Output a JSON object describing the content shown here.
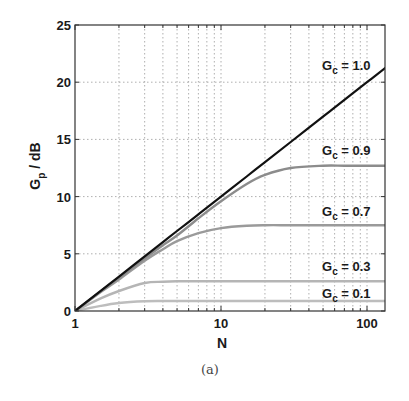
{
  "chart_data": {
    "type": "line",
    "title": "",
    "caption": "(a)",
    "xlabel": "N",
    "ylabel": "G_p / dB",
    "ylabel_main": "G",
    "ylabel_sub": "p",
    "ylabel_rest": " / dB",
    "xscale": "log",
    "xlim": [
      1,
      133
    ],
    "ylim": [
      0,
      25
    ],
    "grid": true,
    "legend": "inline labels",
    "x_ticks": [
      1,
      10,
      100
    ],
    "x_tick_labels": [
      "1",
      "10",
      "100"
    ],
    "y_ticks": [
      0,
      5,
      10,
      15,
      20,
      25
    ],
    "y_tick_labels": [
      "0",
      "5",
      "10",
      "15",
      "20",
      "25"
    ],
    "x": [
      1,
      1.5,
      2,
      3,
      4,
      5,
      7,
      10,
      15,
      20,
      30,
      50,
      70,
      100,
      133
    ],
    "series": [
      {
        "name": "G_c = 1.0",
        "label_main": "G",
        "label_sub": "c",
        "label_rest": " = 1.0",
        "color": "#111111",
        "values": [
          0,
          1.76,
          3.01,
          4.77,
          6.02,
          6.99,
          8.45,
          10.0,
          11.76,
          13.01,
          14.77,
          16.99,
          18.45,
          20.0,
          21.24
        ],
        "label_pos": [
          322,
          70
        ]
      },
      {
        "name": "G_c = 0.9",
        "label_main": "G",
        "label_sub": "c",
        "label_rest": " = 0.9",
        "color": "#8c8c8c",
        "values": [
          0,
          1.72,
          2.9,
          4.6,
          5.75,
          6.6,
          8.1,
          9.6,
          11.1,
          11.9,
          12.5,
          12.7,
          12.7,
          12.7,
          12.7
        ],
        "label_pos": [
          322,
          155
        ]
      },
      {
        "name": "G_c = 0.7",
        "label_main": "G",
        "label_sub": "c",
        "label_rest": " = 0.7",
        "color": "#9a9a9a",
        "values": [
          0,
          1.65,
          2.75,
          4.4,
          5.4,
          6.1,
          6.8,
          7.25,
          7.45,
          7.5,
          7.5,
          7.5,
          7.5,
          7.5,
          7.5
        ],
        "label_pos": [
          322,
          216
        ]
      },
      {
        "name": "G_c = 0.3",
        "label_main": "G",
        "label_sub": "c",
        "label_rest": " = 0.3",
        "color": "#b5b5b5",
        "values": [
          0,
          1.1,
          1.75,
          2.45,
          2.55,
          2.6,
          2.6,
          2.6,
          2.6,
          2.6,
          2.6,
          2.6,
          2.6,
          2.6,
          2.6
        ],
        "label_pos": [
          322,
          271
        ]
      },
      {
        "name": "G_c = 0.1",
        "label_main": "G",
        "label_sub": "c",
        "label_rest": " = 0.1",
        "color": "#bdbdbd",
        "values": [
          0,
          0.45,
          0.7,
          0.85,
          0.87,
          0.87,
          0.87,
          0.87,
          0.87,
          0.87,
          0.87,
          0.87,
          0.87,
          0.87,
          0.87
        ],
        "label_pos": [
          322,
          298
        ]
      }
    ]
  },
  "layout": {
    "plot_left": 75,
    "plot_right": 385,
    "plot_top": 25,
    "plot_bottom": 311,
    "px_per_decade": 146,
    "px_per_db": 11.44
  }
}
